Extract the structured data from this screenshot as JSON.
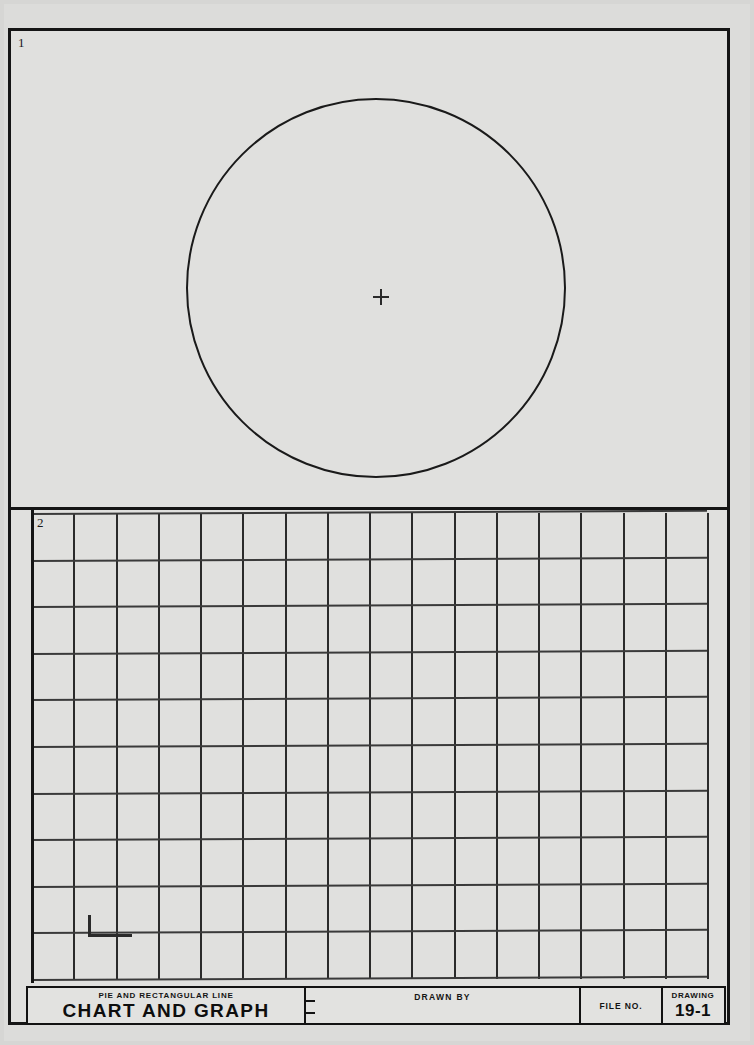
{
  "sheet": {
    "background_color": "#dcdcda",
    "ink_color": "#151515"
  },
  "panels": [
    {
      "number": "1",
      "name": "pie-chart-panel",
      "figure": "circle",
      "center_mark": "plus"
    },
    {
      "number": "2",
      "name": "rectangular-graph-panel",
      "figure": "grid",
      "columns": 16,
      "rows": 10
    }
  ],
  "title_block": {
    "subtitle": "PIE AND RECTANGULAR LINE",
    "title": "CHART AND GRAPH",
    "drawn_by_label": "DRAWN BY",
    "drawn_by_value": "",
    "file_no_label": "FILE NO.",
    "file_no_value": "",
    "drawing_label": "DRAWING",
    "drawing_number": "19-1"
  },
  "chart_data": {
    "type": "pie",
    "title": "CHART AND GRAPH",
    "subtitle": "PIE AND RECTANGULAR LINE",
    "categories": [],
    "values": [],
    "note": "Blank worksheet: empty pie circle with center mark and empty rectangular grid for student plotting",
    "grid": {
      "type": "table",
      "columns": 16,
      "rows": 10,
      "grid": true,
      "xlabel": "",
      "ylabel": ""
    }
  }
}
